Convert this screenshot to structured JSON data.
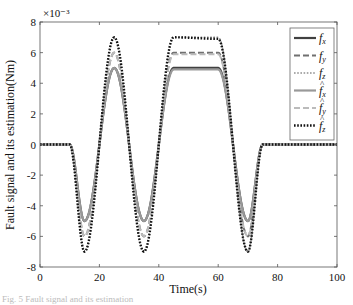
{
  "chart_data": {
    "type": "line",
    "title": "",
    "xlabel": "Time(s)",
    "ylabel": "Fault signal and its estimation(Nm)",
    "y_multiplier": "×10⁻³",
    "xlim": [
      0,
      100
    ],
    "ylim": [
      -8,
      8
    ],
    "xticks": [
      0,
      20,
      40,
      60,
      80,
      100
    ],
    "yticks": [
      -8,
      -6,
      -4,
      -2,
      0,
      2,
      4,
      6,
      8
    ],
    "grid": false,
    "legend_position": "upper right",
    "x": [
      0,
      10,
      15,
      25,
      35,
      45,
      60,
      70,
      75,
      100
    ],
    "series": [
      {
        "name": "f_x",
        "label_main": "f",
        "label_sub": "x",
        "hat": false,
        "style": "solid",
        "color": "#404040",
        "width": 2.2,
        "values": [
          0,
          0,
          -5,
          5,
          -5,
          5,
          5,
          -5,
          0,
          0
        ]
      },
      {
        "name": "f_y",
        "label_main": "f",
        "label_sub": "y",
        "hat": false,
        "style": "dashed",
        "color": "#707070",
        "width": 2.0,
        "values": [
          0,
          0,
          -6,
          6,
          -6,
          6,
          6,
          -6,
          0,
          0
        ]
      },
      {
        "name": "f_z",
        "label_main": "f",
        "label_sub": "z",
        "hat": false,
        "style": "dotted",
        "color": "#909090",
        "width": 1.5,
        "values": [
          0,
          0,
          -7,
          7,
          -7,
          7,
          7,
          -7,
          0,
          0
        ]
      },
      {
        "name": "f̂_x",
        "label_main": "f",
        "label_sub": "x",
        "hat": true,
        "style": "solid",
        "color": "#999999",
        "width": 2.2,
        "values": [
          0,
          0,
          -5,
          5,
          -5,
          4.9,
          4.9,
          -5,
          0,
          0
        ]
      },
      {
        "name": "f̂_y",
        "label_main": "f",
        "label_sub": "y",
        "hat": true,
        "style": "dashed",
        "color": "#bbbbbb",
        "width": 2.0,
        "values": [
          0,
          0,
          -6,
          6,
          -6,
          5.9,
          5.9,
          -6,
          0,
          0
        ]
      },
      {
        "name": "f̂_z",
        "label_main": "f",
        "label_sub": "z",
        "hat": true,
        "style": "dotted",
        "color": "#111111",
        "width": 2.4,
        "values": [
          0,
          0,
          -7,
          7,
          -7,
          7,
          6.9,
          -7,
          0,
          0
        ]
      }
    ]
  },
  "caption": "Fig. 5 Fault signal and its estimation"
}
